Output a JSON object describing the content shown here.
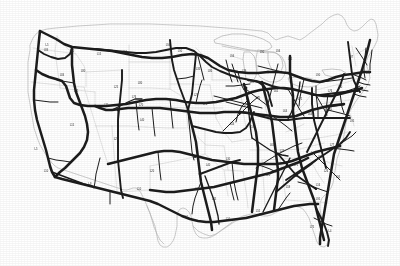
{
  "document": {
    "kind": "scanned-map",
    "title": "United States Interstate Highway System",
    "subject": "Map of the contiguous United States showing the Interstate Highway network",
    "rendering": "low-resolution grayscale scan, no surrounding user interface",
    "background_color": "#ffffff",
    "road_color": "#1c1c1c",
    "border_color": "#b9b9b9",
    "state_line_color": "#cfcfcf"
  },
  "map": {
    "region_label": "Contiguous United States",
    "projection_note": "conic, north at top",
    "features": [
      {
        "name": "national-boundary",
        "label": "U.S. national boundary"
      },
      {
        "name": "state-boundaries",
        "label": "State boundaries"
      },
      {
        "name": "great-lakes",
        "label": "Great Lakes"
      },
      {
        "name": "interstate-network",
        "label": "Interstate highways"
      },
      {
        "name": "route-shield-labels",
        "label": "Route number labels (illegible at scan resolution)"
      }
    ],
    "legibility_note": "Route shield text on the scan is too low-resolution to read"
  },
  "route_labels": [
    {
      "id": "l01",
      "text": "I-5",
      "x": 47,
      "y": 46
    },
    {
      "id": "l02",
      "text": "I-90",
      "x": 72,
      "y": 52
    },
    {
      "id": "l03",
      "text": "I-15",
      "x": 99,
      "y": 55
    },
    {
      "id": "l04",
      "text": "I-94",
      "x": 125,
      "y": 53
    },
    {
      "id": "l05",
      "text": "I-84",
      "x": 46,
      "y": 51
    },
    {
      "id": "l06",
      "text": "I-80",
      "x": 83,
      "y": 72
    },
    {
      "id": "l07",
      "text": "I-29",
      "x": 196,
      "y": 56
    },
    {
      "id": "l08",
      "text": "I-35",
      "x": 198,
      "y": 70
    },
    {
      "id": "l09",
      "text": "I-90",
      "x": 262,
      "y": 53
    },
    {
      "id": "l10",
      "text": "I-94",
      "x": 278,
      "y": 52
    },
    {
      "id": "l11",
      "text": "I-75",
      "x": 290,
      "y": 60
    },
    {
      "id": "l12",
      "text": "I-94",
      "x": 232,
      "y": 57
    },
    {
      "id": "l13",
      "text": "I-80",
      "x": 210,
      "y": 72
    },
    {
      "id": "l14",
      "text": "I-90",
      "x": 318,
      "y": 76
    },
    {
      "id": "l15",
      "text": "I-87",
      "x": 351,
      "y": 58
    },
    {
      "id": "l16",
      "text": "I-95",
      "x": 368,
      "y": 74
    },
    {
      "id": "l17",
      "text": "I-80",
      "x": 340,
      "y": 88
    },
    {
      "id": "l18",
      "text": "I-76",
      "x": 330,
      "y": 92
    },
    {
      "id": "l19",
      "text": "I-70",
      "x": 106,
      "y": 106
    },
    {
      "id": "l20",
      "text": "I-70",
      "x": 141,
      "y": 106
    },
    {
      "id": "l21",
      "text": "I-70",
      "x": 205,
      "y": 105
    },
    {
      "id": "l22",
      "text": "I-70",
      "x": 258,
      "y": 99
    },
    {
      "id": "l23",
      "text": "I-44",
      "x": 232,
      "y": 125
    },
    {
      "id": "l24",
      "text": "I-64",
      "x": 285,
      "y": 112
    },
    {
      "id": "l25",
      "text": "I-64",
      "x": 310,
      "y": 115
    },
    {
      "id": "l26",
      "text": "I-81",
      "x": 330,
      "y": 110
    },
    {
      "id": "l27",
      "text": "I-95",
      "x": 352,
      "y": 122
    },
    {
      "id": "l28",
      "text": "I-40",
      "x": 142,
      "y": 121
    },
    {
      "id": "l29",
      "text": "I-25",
      "x": 116,
      "y": 140
    },
    {
      "id": "l30",
      "text": "I-40",
      "x": 208,
      "y": 166
    },
    {
      "id": "l31",
      "text": "I-40",
      "x": 264,
      "y": 165
    },
    {
      "id": "l32",
      "text": "I-75",
      "x": 296,
      "y": 166
    },
    {
      "id": "l33",
      "text": "I-20",
      "x": 268,
      "y": 176
    },
    {
      "id": "l34",
      "text": "I-85",
      "x": 320,
      "y": 158
    },
    {
      "id": "l35",
      "text": "I-77",
      "x": 332,
      "y": 146
    },
    {
      "id": "l36",
      "text": "I-10",
      "x": 46,
      "y": 172
    },
    {
      "id": "l37",
      "text": "I-8",
      "x": 90,
      "y": 185
    },
    {
      "id": "l38",
      "text": "I-10",
      "x": 139,
      "y": 190
    },
    {
      "id": "l39",
      "text": "I-10",
      "x": 186,
      "y": 218
    },
    {
      "id": "l40",
      "text": "I-10",
      "x": 228,
      "y": 220
    },
    {
      "id": "l41",
      "text": "I-55",
      "x": 258,
      "y": 212
    },
    {
      "id": "l42",
      "text": "I-95",
      "x": 318,
      "y": 200
    },
    {
      "id": "l43",
      "text": "I-75",
      "x": 312,
      "y": 228
    },
    {
      "id": "l44",
      "text": "I-4",
      "x": 330,
      "y": 232
    },
    {
      "id": "l45",
      "text": "I-35",
      "x": 197,
      "y": 190
    },
    {
      "id": "l46",
      "text": "I-45",
      "x": 214,
      "y": 200
    },
    {
      "id": "l47",
      "text": "I-57",
      "x": 252,
      "y": 128
    },
    {
      "id": "l48",
      "text": "I-65",
      "x": 272,
      "y": 146
    },
    {
      "id": "l49",
      "text": "I-24",
      "x": 282,
      "y": 152
    },
    {
      "id": "l50",
      "text": "I-59",
      "x": 288,
      "y": 188
    },
    {
      "id": "l51",
      "text": "I-15",
      "x": 72,
      "y": 126
    },
    {
      "id": "l52",
      "text": "I-5",
      "x": 36,
      "y": 150
    },
    {
      "id": "l53",
      "text": "I-80",
      "x": 140,
      "y": 84
    },
    {
      "id": "l54",
      "text": "I-29",
      "x": 196,
      "y": 96
    },
    {
      "id": "l55",
      "text": "I-88",
      "x": 252,
      "y": 83
    },
    {
      "id": "l56",
      "text": "I-65",
      "x": 276,
      "y": 92
    },
    {
      "id": "l57",
      "text": "I-71",
      "x": 300,
      "y": 100
    },
    {
      "id": "l58",
      "text": "I-20",
      "x": 152,
      "y": 172
    },
    {
      "id": "l59",
      "text": "I-30",
      "x": 228,
      "y": 160
    },
    {
      "id": "l60",
      "text": "I-95",
      "x": 338,
      "y": 178
    },
    {
      "id": "l61",
      "text": "I-26",
      "x": 326,
      "y": 172
    },
    {
      "id": "l62",
      "text": "I-16",
      "x": 318,
      "y": 186
    },
    {
      "id": "l63",
      "text": "I-90",
      "x": 180,
      "y": 52
    },
    {
      "id": "l64",
      "text": "I-94",
      "x": 168,
      "y": 46
    },
    {
      "id": "l65",
      "text": "I-15",
      "x": 76,
      "y": 92
    },
    {
      "id": "l66",
      "text": "I-84",
      "x": 62,
      "y": 76
    },
    {
      "id": "l67",
      "text": "I-25",
      "x": 116,
      "y": 88
    },
    {
      "id": "l68",
      "text": "I-76",
      "x": 134,
      "y": 98
    },
    {
      "id": "l69",
      "text": "I-72",
      "x": 246,
      "y": 106
    },
    {
      "id": "l70",
      "text": "I-39",
      "x": 244,
      "y": 72
    }
  ]
}
